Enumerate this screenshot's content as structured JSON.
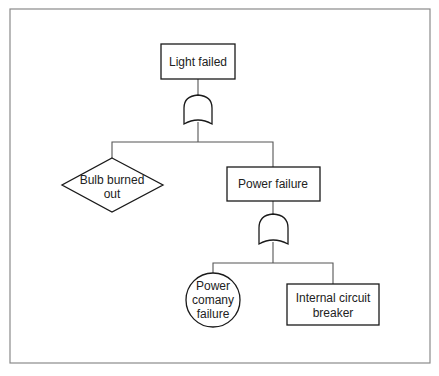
{
  "diagram": {
    "type": "fault-tree",
    "nodes": [
      {
        "id": "top",
        "kind": "event-rectangle",
        "label_lines": [
          "Light failed"
        ]
      },
      {
        "id": "gate1",
        "kind": "or-gate",
        "label_lines": []
      },
      {
        "id": "bulb",
        "kind": "undeveloped-event-diamond",
        "label_lines": [
          "Bulb burned",
          "out"
        ]
      },
      {
        "id": "power",
        "kind": "event-rectangle",
        "label_lines": [
          "Power failure"
        ]
      },
      {
        "id": "gate2",
        "kind": "or-gate",
        "label_lines": []
      },
      {
        "id": "company",
        "kind": "basic-event-circle",
        "label_lines": [
          "Power",
          "comany",
          "failure"
        ]
      },
      {
        "id": "breaker",
        "kind": "event-rectangle",
        "label_lines": [
          "Internal circuit",
          "breaker"
        ]
      }
    ],
    "edges": [
      {
        "from": "top",
        "to": "gate1"
      },
      {
        "from": "gate1",
        "to": "bulb"
      },
      {
        "from": "gate1",
        "to": "power"
      },
      {
        "from": "power",
        "to": "gate2"
      },
      {
        "from": "gate2",
        "to": "company"
      },
      {
        "from": "gate2",
        "to": "breaker"
      }
    ]
  }
}
